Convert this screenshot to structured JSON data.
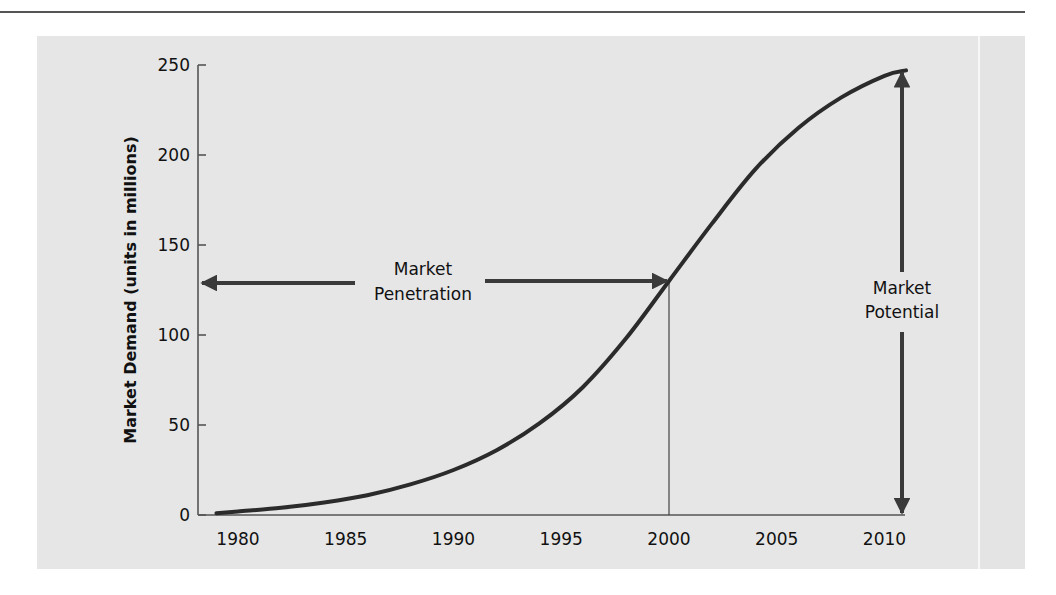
{
  "page": {
    "top_rule_color": "#555555",
    "panel_background": "#e6e6e6"
  },
  "chart_data": {
    "type": "line",
    "title": "",
    "xlabel": "",
    "ylabel": "Market Demand (units in millions)",
    "xlim": [
      1979,
      2011
    ],
    "ylim": [
      0,
      250
    ],
    "x_ticks": [
      1980,
      1985,
      1990,
      1995,
      2000,
      2005,
      2010
    ],
    "x_tick_labels": [
      "1980",
      "1985",
      "1990",
      "1995",
      "2000",
      "2005",
      "2010"
    ],
    "y_ticks": [
      0,
      50,
      100,
      150,
      200,
      250
    ],
    "y_tick_labels": [
      "0",
      "50",
      "100",
      "150",
      "200",
      "250"
    ],
    "grid": false,
    "legend": null,
    "series": [
      {
        "name": "Market Demand",
        "x": [
          1979,
          1980,
          1982,
          1984,
          1986,
          1988,
          1990,
          1992,
          1994,
          1996,
          1998,
          2000,
          2002,
          2004,
          2006,
          2008,
          2010,
          2011
        ],
        "values": [
          1,
          2,
          4,
          7,
          11,
          17,
          25,
          36,
          51,
          71,
          98,
          130,
          162,
          192,
          215,
          232,
          244,
          247
        ]
      }
    ],
    "annotations": [
      {
        "id": "market-penetration",
        "label_line1": "Market",
        "label_line2": "Penetration",
        "type": "double-arrow-horizontal",
        "from_x": 1979,
        "to_x": 2000,
        "y": 130
      },
      {
        "id": "market-potential",
        "label_line1": "Market",
        "label_line2": "Potential",
        "type": "double-arrow-vertical",
        "x": 2010,
        "from_y": 0,
        "to_y": 247
      },
      {
        "id": "year-2000-marker",
        "type": "vertical-line",
        "x": 2000,
        "from_y": 0,
        "to_y": 130
      }
    ],
    "colors": {
      "curve": "#2b2b2b",
      "arrows": "#3a3a3a",
      "axes": "#555555",
      "text": "#111111"
    }
  }
}
